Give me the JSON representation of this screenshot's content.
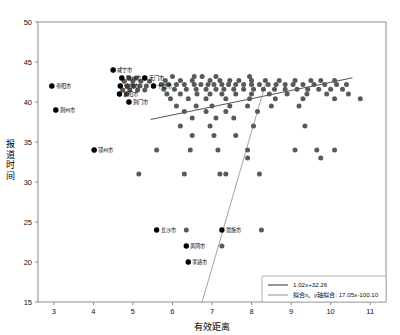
{
  "chart_data": {
    "type": "scatter",
    "title": "",
    "xlabel": "有效距离",
    "ylabel": "报道时间",
    "xlim": [
      2.6,
      11.4
    ],
    "ylim": [
      15,
      50
    ],
    "xticks": [
      3,
      4,
      5,
      6,
      7,
      8,
      9,
      10,
      11
    ],
    "yticks": [
      15,
      20,
      25,
      30,
      35,
      40,
      45,
      50
    ],
    "grid": false,
    "marker_color": "#595959",
    "labeled_marker_color": "#000000",
    "legend_position": "bottom-right",
    "series": [
      {
        "name": "points",
        "points": [
          [
            2.95,
            42.0
          ],
          [
            3.05,
            39.0
          ],
          [
            4.5,
            44.0
          ],
          [
            4.72,
            43.0
          ],
          [
            4.9,
            43.0
          ],
          [
            5.08,
            43.0
          ],
          [
            5.3,
            43.0
          ],
          [
            4.78,
            42.6
          ],
          [
            5.0,
            42.6
          ],
          [
            5.2,
            42.6
          ],
          [
            5.42,
            42.6
          ],
          [
            4.68,
            42.0
          ],
          [
            4.86,
            42.0
          ],
          [
            5.02,
            42.0
          ],
          [
            5.18,
            42.0
          ],
          [
            5.34,
            42.0
          ],
          [
            5.52,
            42.0
          ],
          [
            4.74,
            41.5
          ],
          [
            4.92,
            41.5
          ],
          [
            5.12,
            41.5
          ],
          [
            5.3,
            41.5
          ],
          [
            4.66,
            41.0
          ],
          [
            4.84,
            41.0
          ],
          [
            4.9,
            40.0
          ],
          [
            4.02,
            34.0
          ],
          [
            6.0,
            43.2
          ],
          [
            6.55,
            43.2
          ],
          [
            6.75,
            43.2
          ],
          [
            7.1,
            43.2
          ],
          [
            7.95,
            43.2
          ],
          [
            5.82,
            42.7
          ],
          [
            6.2,
            42.7
          ],
          [
            6.5,
            42.7
          ],
          [
            6.95,
            42.7
          ],
          [
            7.2,
            42.7
          ],
          [
            7.45,
            42.7
          ],
          [
            7.68,
            42.7
          ],
          [
            8.0,
            42.7
          ],
          [
            8.35,
            42.7
          ],
          [
            8.7,
            42.7
          ],
          [
            9.1,
            42.7
          ],
          [
            9.5,
            42.7
          ],
          [
            9.75,
            42.7
          ],
          [
            10.1,
            42.7
          ],
          [
            5.72,
            42.2
          ],
          [
            5.9,
            42.2
          ],
          [
            6.1,
            42.2
          ],
          [
            6.3,
            42.2
          ],
          [
            6.55,
            42.2
          ],
          [
            6.72,
            42.2
          ],
          [
            6.9,
            42.2
          ],
          [
            7.05,
            42.2
          ],
          [
            7.25,
            42.2
          ],
          [
            7.42,
            42.2
          ],
          [
            7.6,
            42.2
          ],
          [
            7.8,
            42.2
          ],
          [
            8.0,
            42.2
          ],
          [
            8.2,
            42.2
          ],
          [
            8.42,
            42.2
          ],
          [
            8.62,
            42.2
          ],
          [
            8.85,
            42.2
          ],
          [
            9.05,
            42.2
          ],
          [
            9.3,
            42.2
          ],
          [
            9.58,
            42.2
          ],
          [
            9.85,
            42.2
          ],
          [
            10.15,
            42.2
          ],
          [
            10.4,
            42.2
          ],
          [
            5.78,
            41.6
          ],
          [
            6.05,
            41.6
          ],
          [
            6.35,
            41.6
          ],
          [
            6.6,
            41.6
          ],
          [
            6.85,
            41.6
          ],
          [
            7.1,
            41.6
          ],
          [
            7.3,
            41.6
          ],
          [
            7.55,
            41.6
          ],
          [
            7.8,
            41.6
          ],
          [
            8.05,
            41.6
          ],
          [
            8.3,
            41.6
          ],
          [
            8.58,
            41.6
          ],
          [
            8.85,
            41.6
          ],
          [
            9.15,
            41.6
          ],
          [
            9.42,
            41.6
          ],
          [
            9.7,
            41.6
          ],
          [
            10.0,
            41.6
          ],
          [
            10.3,
            41.6
          ],
          [
            5.86,
            41.0
          ],
          [
            6.2,
            41.0
          ],
          [
            6.62,
            41.0
          ],
          [
            6.95,
            41.0
          ],
          [
            7.25,
            41.0
          ],
          [
            7.6,
            41.0
          ],
          [
            8.0,
            41.0
          ],
          [
            8.45,
            41.0
          ],
          [
            8.9,
            41.0
          ],
          [
            9.4,
            41.0
          ],
          [
            9.9,
            41.0
          ],
          [
            10.45,
            41.0
          ],
          [
            5.95,
            40.4
          ],
          [
            6.4,
            40.4
          ],
          [
            6.85,
            40.4
          ],
          [
            7.35,
            40.4
          ],
          [
            7.95,
            40.4
          ],
          [
            8.6,
            40.4
          ],
          [
            9.3,
            40.4
          ],
          [
            10.1,
            40.4
          ],
          [
            10.75,
            40.4
          ],
          [
            6.1,
            39.5
          ],
          [
            6.6,
            39.5
          ],
          [
            7.0,
            39.5
          ],
          [
            7.45,
            39.5
          ],
          [
            7.9,
            39.5
          ],
          [
            8.5,
            39.5
          ],
          [
            9.2,
            39.5
          ],
          [
            6.3,
            38.8
          ],
          [
            6.85,
            38.8
          ],
          [
            7.35,
            38.8
          ],
          [
            8.15,
            38.8
          ],
          [
            6.5,
            38.0
          ],
          [
            7.1,
            38.0
          ],
          [
            7.55,
            38.0
          ],
          [
            6.2,
            37.0
          ],
          [
            6.95,
            37.0
          ],
          [
            8.05,
            37.0
          ],
          [
            9.35,
            37.0
          ],
          [
            6.5,
            35.8
          ],
          [
            7.05,
            35.8
          ],
          [
            7.6,
            35.8
          ],
          [
            5.6,
            34.0
          ],
          [
            6.45,
            34.0
          ],
          [
            7.15,
            34.0
          ],
          [
            7.9,
            34.0
          ],
          [
            9.1,
            34.0
          ],
          [
            9.65,
            34.0
          ],
          [
            10.1,
            34.0
          ],
          [
            7.9,
            33.0
          ],
          [
            9.75,
            33.0
          ],
          [
            5.15,
            31.0
          ],
          [
            6.3,
            31.0
          ],
          [
            7.2,
            31.0
          ],
          [
            7.35,
            31.0
          ],
          [
            8.2,
            31.0
          ],
          [
            6.35,
            24.0
          ],
          [
            8.25,
            24.0
          ],
          [
            7.25,
            22.0
          ],
          [
            6.4,
            20.0
          ]
        ]
      }
    ],
    "labeled_points": [
      {
        "label": "枣阳市",
        "x": 2.95,
        "y": 42.0,
        "dx": 4,
        "dy": 1.5
      },
      {
        "label": "荆州市",
        "x": 3.05,
        "y": 39.0,
        "dx": 4,
        "dy": 1.5
      },
      {
        "label": "咸宁市",
        "x": 4.5,
        "y": 44.0,
        "dx": 4,
        "dy": 1.5
      },
      {
        "label": "随州市",
        "x": 4.72,
        "y": 43.0,
        "dx": 4,
        "dy": 1.5
      },
      {
        "label": "天门市",
        "x": 5.3,
        "y": 43.0,
        "dx": 4,
        "dy": 1.5
      },
      {
        "label": "仙桃市",
        "x": 4.68,
        "y": 42.0,
        "dx": 4,
        "dy": 1.5
      },
      {
        "label": "十堰市",
        "x": 5.52,
        "y": 42.0,
        "dx": 4,
        "dy": 1.5
      },
      {
        "label": "襄阳市",
        "x": 4.66,
        "y": 41.0,
        "dx": 4,
        "dy": 1.5
      },
      {
        "label": "荆门市",
        "x": 4.9,
        "y": 40.0,
        "dx": 4,
        "dy": 1.5
      },
      {
        "label": "鄂州市",
        "x": 4.02,
        "y": 34.0,
        "dx": 4,
        "dy": 1.5
      },
      {
        "label": "长沙市",
        "x": 5.6,
        "y": 24.0,
        "dx": 4,
        "dy": 1.5
      },
      {
        "label": "黄冈市",
        "x": 6.35,
        "y": 22.0,
        "dx": 4,
        "dy": 1.5
      },
      {
        "label": "恩施市",
        "x": 7.25,
        "y": 24.0,
        "dx": 4,
        "dy": 1.5
      },
      {
        "label": "孝感市",
        "x": 6.4,
        "y": 20.0,
        "dx": 4,
        "dy": 1.5
      }
    ],
    "lines": [
      {
        "name": "fit-shallow",
        "equation": "1.02x+32.26",
        "slope": 1.02,
        "intercept": 32.26,
        "color": "#3f3f3f",
        "x_from": 5.45,
        "x_to": 10.55
      },
      {
        "name": "fit-steep",
        "equation": "17.05x-100.10",
        "slope": 17.05,
        "intercept": -100.1,
        "color": "#9a9a9a",
        "x_from": 6.75,
        "x_to": 8.35
      }
    ]
  },
  "legend": {
    "entries": [
      {
        "label": "1.02x+32.26",
        "color": "#3f3f3f"
      },
      {
        "label": "拟合x、y轴拟合: 17.05x-100.10",
        "color": "#9a9a9a"
      }
    ]
  },
  "axes": {
    "x_title": "有效距离",
    "y_title": "报道时间",
    "x_tick_labels": [
      "3",
      "4",
      "5",
      "6",
      "7",
      "8",
      "9",
      "10",
      "11"
    ],
    "y_tick_labels": [
      "15",
      "20",
      "25",
      "30",
      "35",
      "40",
      "45",
      "50"
    ]
  }
}
